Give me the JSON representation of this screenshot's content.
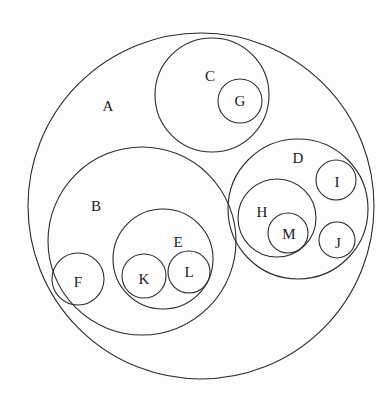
{
  "diagram": {
    "type": "nested-circle-venn-diagram",
    "background_color": "#fdfdfd",
    "stroke_color": "#2b2b2b",
    "label_color": "#1a1a1a",
    "canvas": {
      "width": 391,
      "height": 400
    },
    "circles": [
      {
        "id": "A",
        "label": "A",
        "cx": 201,
        "cy": 206,
        "r": 173,
        "label_x": 108,
        "label_y": 106,
        "parent": null
      },
      {
        "id": "B",
        "label": "B",
        "cx": 142,
        "cy": 241,
        "r": 94,
        "label_x": 96,
        "label_y": 206,
        "parent": "A"
      },
      {
        "id": "C",
        "label": "C",
        "cx": 212,
        "cy": 95,
        "r": 57,
        "label_x": 210,
        "label_y": 76,
        "parent": "A"
      },
      {
        "id": "D",
        "label": "D",
        "cx": 298,
        "cy": 209,
        "r": 70,
        "label_x": 298,
        "label_y": 158,
        "parent": "A"
      },
      {
        "id": "E",
        "label": "E",
        "cx": 163,
        "cy": 259,
        "r": 50,
        "label_x": 178,
        "label_y": 242,
        "parent": "B"
      },
      {
        "id": "F",
        "label": "F",
        "cx": 78,
        "cy": 279,
        "r": 26,
        "label_x": 78,
        "label_y": 282,
        "parent": "B"
      },
      {
        "id": "G",
        "label": "G",
        "cx": 240,
        "cy": 101,
        "r": 22,
        "label_x": 240,
        "label_y": 101,
        "parent": "C"
      },
      {
        "id": "H",
        "label": "H",
        "cx": 277,
        "cy": 218,
        "r": 39,
        "label_x": 262,
        "label_y": 212,
        "parent": "D"
      },
      {
        "id": "I",
        "label": "I",
        "cx": 336,
        "cy": 180,
        "r": 20,
        "label_x": 337,
        "label_y": 182,
        "parent": "D"
      },
      {
        "id": "J",
        "label": "J",
        "cx": 337,
        "cy": 240,
        "r": 18,
        "label_x": 338,
        "label_y": 243,
        "parent": "D"
      },
      {
        "id": "K",
        "label": "K",
        "cx": 144,
        "cy": 276,
        "r": 22,
        "label_x": 144,
        "label_y": 279,
        "parent": "E"
      },
      {
        "id": "L",
        "label": "L",
        "cx": 189,
        "cy": 272,
        "r": 21,
        "label_x": 189,
        "label_y": 272,
        "parent": "E"
      },
      {
        "id": "M",
        "label": "M",
        "cx": 288,
        "cy": 233,
        "r": 20,
        "label_x": 289,
        "label_y": 234,
        "parent": "H"
      }
    ]
  }
}
